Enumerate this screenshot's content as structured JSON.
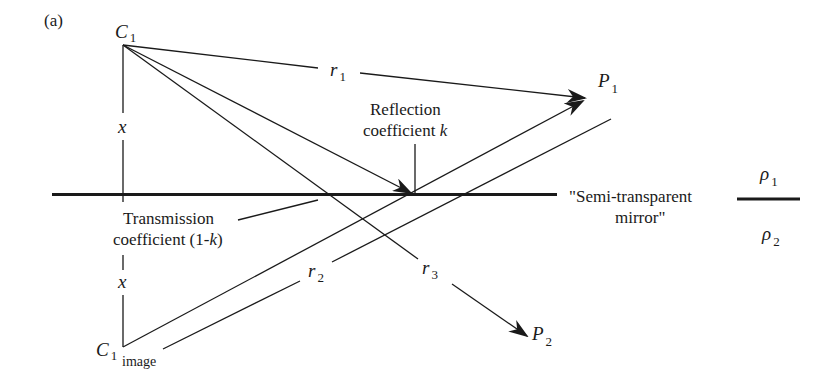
{
  "figure": {
    "panel_label": "(a)",
    "points": {
      "source": {
        "symbol": "C",
        "subscript": "1"
      },
      "image": {
        "symbol": "C",
        "subscript": "1",
        "sub2": "image"
      },
      "p1": {
        "symbol": "P",
        "subscript": "1"
      },
      "p2": {
        "symbol": "P",
        "subscript": "2"
      }
    },
    "distances": {
      "x_top": "x",
      "x_bottom": "x",
      "r1": {
        "symbol": "r",
        "subscript": "1"
      },
      "r2": {
        "symbol": "r",
        "subscript": "2"
      },
      "r3": {
        "symbol": "r",
        "subscript": "3"
      }
    },
    "annotations": {
      "reflection_line1": "Reflection",
      "reflection_line2_prefix": "coefficient ",
      "reflection_symbol": "k",
      "transmission_line1": "Transmission",
      "transmission_line2_prefix": "coefficient (1-",
      "transmission_symbol": "k",
      "transmission_line2_suffix": ")",
      "mirror_line1": "\"Semi-transparent",
      "mirror_line2": "mirror\""
    },
    "media": {
      "upper": {
        "symbol": "ρ",
        "subscript": "1"
      },
      "lower": {
        "symbol": "ρ",
        "subscript": "2"
      }
    }
  }
}
